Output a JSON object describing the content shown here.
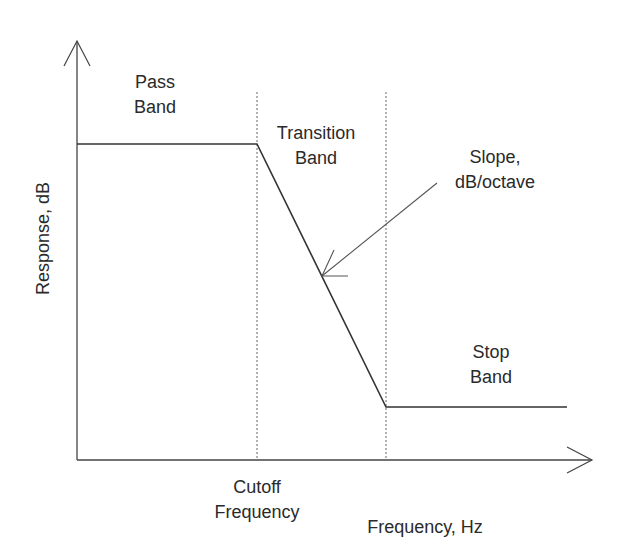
{
  "diagram": {
    "title": "",
    "y_axis_label": "Response, dB",
    "x_axis_label": "Frequency, Hz",
    "regions": [
      {
        "label_line1": "Pass",
        "label_line2": "Band"
      },
      {
        "label_line1": "Transition",
        "label_line2": "Band"
      },
      {
        "label_line1": "Stop",
        "label_line2": "Band"
      }
    ],
    "annotations": {
      "slope_line1": "Slope,",
      "slope_line2": "dB/octave",
      "cutoff_line1": "Cutoff",
      "cutoff_line2": "Frequency"
    },
    "colors": {
      "line": "#333333",
      "text": "#2a2a2a",
      "dashed": "#555555",
      "background": "#ffffff"
    }
  }
}
